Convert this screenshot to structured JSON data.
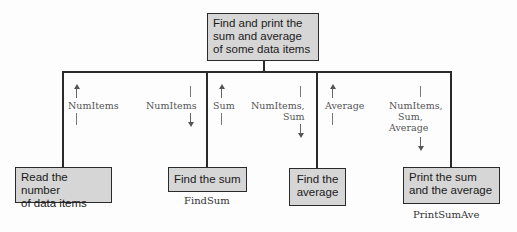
{
  "diagram": {
    "type": "structure-chart",
    "root": {
      "label": "Find and print the sum and average of some data items",
      "lines": [
        "Find and print the",
        "sum and average",
        "of some data items"
      ]
    },
    "children": [
      {
        "id": "read",
        "lines": [
          "Read the number",
          "of data items"
        ],
        "module_name": ""
      },
      {
        "id": "findsum",
        "lines": [
          "Find the sum"
        ],
        "module_name": "FindSum"
      },
      {
        "id": "average",
        "lines": [
          "Find the",
          "average"
        ],
        "module_name": ""
      },
      {
        "id": "print",
        "lines": [
          "Print the sum",
          "and the average"
        ],
        "module_name": "PrintSumAve"
      }
    ],
    "data_flows": [
      {
        "label": "NumItems",
        "direction": "up",
        "child": "read"
      },
      {
        "label": "NumItems",
        "direction": "down",
        "child": "findsum"
      },
      {
        "label": "Sum",
        "direction": "up",
        "child": "findsum"
      },
      {
        "label": "NumItems,\nSum",
        "direction": "down",
        "child": "average"
      },
      {
        "label": "Average",
        "direction": "up",
        "child": "average"
      },
      {
        "label": "NumItems,\n   Sum,\nAverage",
        "direction": "down",
        "child": "print"
      }
    ]
  }
}
